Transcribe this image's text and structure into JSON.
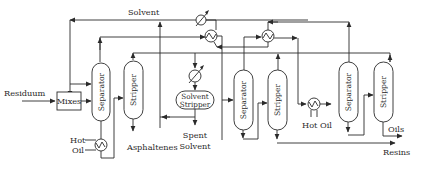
{
  "diagram": {
    "type": "process-flow",
    "streams": {
      "solvent": "Solvent",
      "residuum": "Residuum",
      "hot_oil_1": "Hot",
      "hot_oil_1b": "Oil",
      "asphaltenes": "Asphaltenes",
      "spent": "Spent",
      "solvent2": "Solvent",
      "hot_oil_2": "Hot Oil",
      "oils": "Oils",
      "resins": "Resins"
    },
    "units": {
      "mixer": "Mixes",
      "separator_1": "Separator",
      "stripper_1": "Stripper",
      "solvent_stripper_1": "Solvent",
      "solvent_stripper_2": "Stripper",
      "separator_2": "Separator",
      "stripper_2": "Stripper",
      "separator_3": "Separator",
      "stripper_3": "Stripper"
    },
    "icons": [
      "heat-exchanger-icon",
      "cooler-icon",
      "heater-icon",
      "arrow-icon"
    ]
  }
}
